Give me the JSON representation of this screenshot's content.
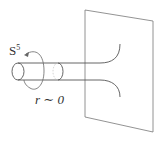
{
  "diagram": {
    "labels": {
      "sphere": "S",
      "sphere_exponent": "5",
      "radius": "r ∼ 0"
    },
    "elements": [
      "plane",
      "tube",
      "rotation-arrow",
      "flared-throat"
    ],
    "colors": {
      "stroke": "#555555",
      "faint_stroke": "#aaaaaa",
      "text": "#333333",
      "background": "#ffffff"
    }
  }
}
